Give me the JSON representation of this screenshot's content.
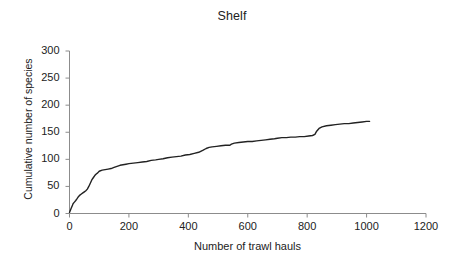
{
  "chart_data": {
    "type": "line",
    "title": "Shelf",
    "xlabel": "Number of trawl hauls",
    "ylabel": "Cumulative number of species",
    "xlim": [
      0,
      1200
    ],
    "ylim": [
      0,
      300
    ],
    "xticks": [
      0,
      200,
      400,
      600,
      800,
      1000,
      1200
    ],
    "yticks": [
      0,
      50,
      100,
      150,
      200,
      250,
      300
    ],
    "grid": false,
    "legend": null,
    "series": [
      {
        "name": "Cumulative species accumulation",
        "line_color": "#222222",
        "x": [
          0,
          3,
          6,
          9,
          12,
          15,
          18,
          21,
          25,
          30,
          35,
          40,
          45,
          50,
          55,
          60,
          65,
          70,
          75,
          80,
          85,
          90,
          95,
          100,
          110,
          120,
          130,
          140,
          150,
          160,
          170,
          180,
          190,
          200,
          215,
          230,
          245,
          260,
          275,
          290,
          300,
          315,
          330,
          345,
          360,
          375,
          390,
          405,
          420,
          435,
          450,
          460,
          470,
          480,
          495,
          510,
          525,
          540,
          545,
          555,
          570,
          585,
          600,
          615,
          630,
          645,
          660,
          675,
          690,
          700,
          715,
          730,
          745,
          760,
          775,
          790,
          805,
          818,
          826,
          832,
          840,
          850,
          865,
          880,
          895,
          910,
          925,
          940,
          955,
          970,
          985,
          1000,
          1010
        ],
        "y": [
          2,
          6,
          10,
          14,
          18,
          20,
          22,
          24,
          27,
          31,
          34,
          36,
          38,
          40,
          42,
          45,
          50,
          56,
          62,
          66,
          70,
          73,
          75,
          78,
          80,
          81,
          82,
          83,
          85,
          87,
          89,
          90,
          91,
          92,
          93,
          94,
          95,
          96,
          98,
          99,
          100,
          101,
          103,
          104,
          105,
          106,
          108,
          109,
          111,
          113,
          117,
          120,
          122,
          123,
          124,
          125,
          126,
          126,
          128,
          130,
          131,
          132,
          133,
          133,
          134,
          135,
          136,
          137,
          138,
          139,
          140,
          140,
          141,
          141,
          142,
          142,
          143,
          144,
          146,
          152,
          157,
          160,
          162,
          163,
          164,
          165,
          166,
          166,
          167,
          168,
          169,
          170,
          170
        ]
      }
    ]
  },
  "axes": {
    "axis_color": "#8c8c8c",
    "tick_color": "#8c8c8c",
    "text_color": "#222222"
  }
}
